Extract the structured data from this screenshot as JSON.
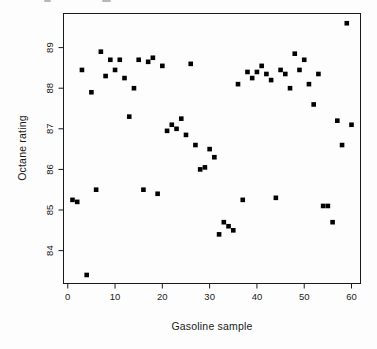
{
  "figure": {
    "background": "#fdfdfd",
    "ink_color": "#1a1a1a",
    "marker_color": "#000000"
  },
  "chart_data": {
    "type": "scatter",
    "title": "",
    "xlabel": "Gasoline sample",
    "ylabel": "Octane rating",
    "marker": "filled-square",
    "marker_color": "#000000",
    "grid": false,
    "legend": null,
    "x_ticks": [
      0,
      10,
      20,
      30,
      40,
      50,
      60
    ],
    "y_ticks": [
      84,
      85,
      86,
      87,
      88,
      89
    ],
    "xlim": [
      -0.9,
      61.9
    ],
    "ylim": [
      83.19,
      89.84
    ],
    "x": [
      1,
      2,
      3,
      4,
      5,
      6,
      7,
      8,
      9,
      10,
      11,
      12,
      13,
      14,
      15,
      16,
      17,
      18,
      19,
      20,
      21,
      22,
      23,
      24,
      25,
      26,
      27,
      28,
      29,
      30,
      31,
      32,
      33,
      34,
      35,
      36,
      37,
      38,
      39,
      40,
      41,
      42,
      43,
      44,
      45,
      46,
      47,
      48,
      49,
      50,
      51,
      52,
      53,
      54,
      55,
      56,
      57,
      58,
      59,
      60
    ],
    "y": [
      85.25,
      85.2,
      88.45,
      83.4,
      87.9,
      85.5,
      88.9,
      88.3,
      88.7,
      88.45,
      88.7,
      88.25,
      87.3,
      88.0,
      88.7,
      85.5,
      88.65,
      88.75,
      85.4,
      88.55,
      86.95,
      87.1,
      87.0,
      87.25,
      86.85,
      88.6,
      86.6,
      86.0,
      86.05,
      86.5,
      86.3,
      84.4,
      84.7,
      84.6,
      84.5,
      88.1,
      85.25,
      88.4,
      88.25,
      88.4,
      88.55,
      88.35,
      88.2,
      85.3,
      88.45,
      88.35,
      88.0,
      88.85,
      88.45,
      88.7,
      88.1,
      87.6,
      88.35,
      85.1,
      85.1,
      84.7,
      87.2,
      86.6,
      89.6,
      87.1
    ]
  }
}
